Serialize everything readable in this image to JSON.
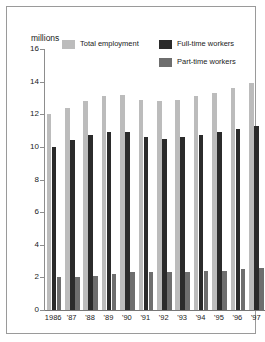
{
  "figure": {
    "unit_label": "millions"
  },
  "legend": {
    "items": [
      {
        "label": "Total employment",
        "key": "total",
        "color": "#bcbcbc"
      },
      {
        "label": "Full-time workers",
        "key": "full",
        "color": "#2b2b2b"
      },
      {
        "label": "Part-time workers",
        "key": "part",
        "color": "#6e6e6e"
      }
    ]
  },
  "chart_data": {
    "type": "bar",
    "title": "",
    "subtitle": "",
    "xlabel": "",
    "ylabel": "millions",
    "ylim": [
      0,
      16
    ],
    "yticks": [
      0,
      2,
      4,
      6,
      8,
      10,
      12,
      14,
      16
    ],
    "ytick_labels": [
      "0",
      "2",
      "4",
      "6",
      "8",
      "10",
      "12",
      "14",
      "16"
    ],
    "grid": false,
    "legend_position": "top",
    "categories": [
      "1986",
      "'87",
      "'88",
      "'89",
      "'90",
      "'91",
      "'92",
      "'93",
      "'94",
      "'95",
      "'96",
      "'97"
    ],
    "series": [
      {
        "name": "Total employment",
        "color": "#bcbcbc",
        "values": [
          12.0,
          12.4,
          12.8,
          13.1,
          13.2,
          12.9,
          12.8,
          12.9,
          13.1,
          13.3,
          13.6,
          13.9
        ]
      },
      {
        "name": "Full-time workers",
        "color": "#2b2b2b",
        "values": [
          10.0,
          10.4,
          10.7,
          10.9,
          10.9,
          10.6,
          10.5,
          10.6,
          10.7,
          10.9,
          11.1,
          11.3
        ]
      },
      {
        "name": "Part-time workers",
        "color": "#6e6e6e",
        "values": [
          2.0,
          2.0,
          2.1,
          2.2,
          2.3,
          2.3,
          2.3,
          2.3,
          2.4,
          2.4,
          2.5,
          2.6
        ]
      }
    ]
  }
}
